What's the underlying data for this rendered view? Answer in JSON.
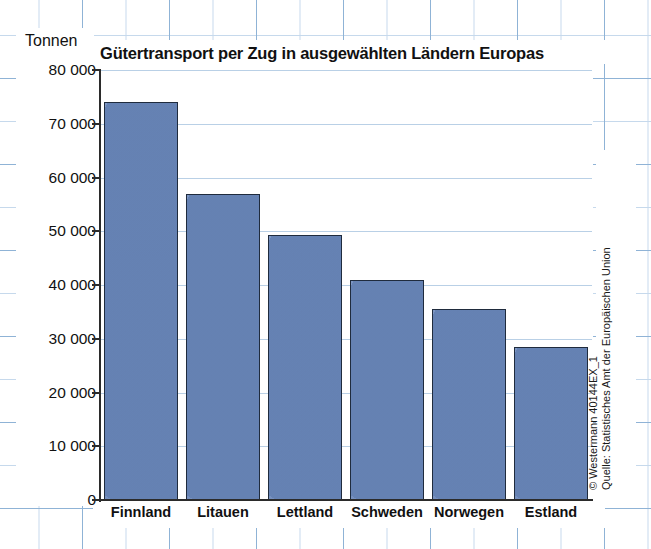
{
  "chart_data": {
    "type": "bar",
    "title": "Gütertransport per Zug in ausgewählten Ländern Europas",
    "xlabel": "",
    "ylabel": "Tonnen",
    "categories": [
      "Finnland",
      "Litauen",
      "Lettland",
      "Schweden",
      "Norwegen",
      "Estland"
    ],
    "values": [
      74000,
      57000,
      49300,
      41000,
      35500,
      28400
    ],
    "ylim": [
      0,
      80000
    ],
    "ytick_values": [
      0,
      10000,
      20000,
      30000,
      40000,
      50000,
      60000,
      70000,
      80000
    ],
    "ytick_labels": [
      "0",
      "10 000",
      "20 000",
      "30 000",
      "40 000",
      "50 000",
      "60 000",
      "70 000",
      "80 000"
    ],
    "grid": true,
    "legend": false,
    "bar_color": "#6e8dc3",
    "bar_border_color": "#1f2b3d",
    "gridline_color": "#b9d0e6",
    "axis_color": "#2b2b2b",
    "background_color": "#ffffff"
  },
  "axis": {
    "unit_label": "Tonnen"
  },
  "source": {
    "copyright": "© Westermann 40144EX_1",
    "credit": "Quelle: Statistisches Amt der Europäischen Union"
  }
}
